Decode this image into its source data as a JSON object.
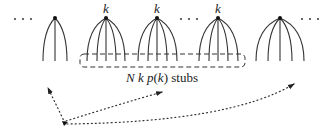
{
  "diagram": {
    "type": "configuration-model-stubs",
    "colors": {
      "line": "#333333",
      "background": "#ffffff"
    },
    "ellipses": [
      {
        "name": "left",
        "text": "· · ·",
        "x": 14,
        "y": 19
      },
      {
        "name": "middle",
        "text": "· · ·",
        "x": 180,
        "y": 19
      },
      {
        "name": "right",
        "text": "· · ·",
        "x": 302,
        "y": 19
      }
    ],
    "nodes": [
      {
        "id": "node-1",
        "label": "",
        "apex": [
          55,
          18
        ],
        "stubs": 3,
        "degree_label_visible": false,
        "in_box": false
      },
      {
        "id": "node-2",
        "label": "k",
        "apex": [
          106,
          18
        ],
        "stubs": 5,
        "degree_label_visible": true,
        "in_box": true
      },
      {
        "id": "node-3",
        "label": "k",
        "apex": [
          157,
          18
        ],
        "stubs": 5,
        "degree_label_visible": true,
        "in_box": true
      },
      {
        "id": "node-4",
        "label": "k",
        "apex": [
          218,
          18
        ],
        "stubs": 5,
        "degree_label_visible": true,
        "in_box": true
      },
      {
        "id": "node-5",
        "label": "",
        "apex": [
          280,
          18
        ],
        "stubs": 5,
        "degree_label_visible": false,
        "in_box": false
      }
    ],
    "box": {
      "style": "dashed-rounded",
      "label_parts": {
        "N": "N",
        "k": "k",
        "p": "p",
        "open": "(",
        "arg": "k",
        "close": ")",
        "suffix": " stubs"
      },
      "label": "N k p(k) stubs"
    },
    "arrows": {
      "style": "dotted",
      "origin": [
        65,
        124
      ],
      "targets": [
        {
          "name": "to-node-1",
          "to": [
            47,
            86
          ]
        },
        {
          "name": "to-box-label",
          "to": [
            163,
            92
          ]
        },
        {
          "name": "to-node-5",
          "to": [
            295,
            82
          ]
        }
      ]
    }
  }
}
